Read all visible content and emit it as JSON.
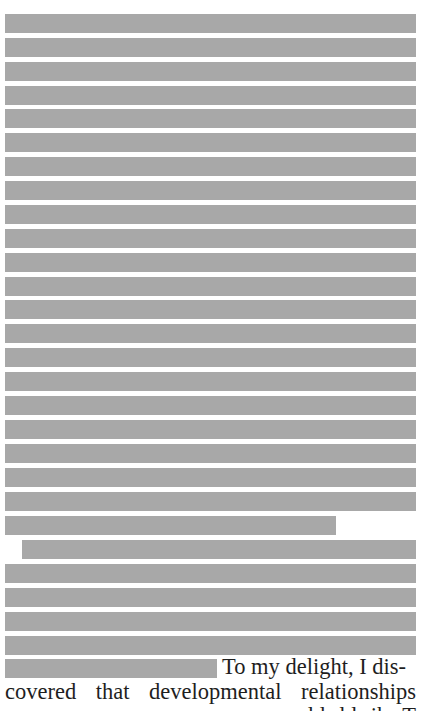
{
  "document": {
    "redaction_color": "#a8a8a8",
    "text_color": "#1e1e1e",
    "redacted_lines": [
      {
        "left": 5,
        "top": 14,
        "width": 411
      },
      {
        "left": 5,
        "top": 38,
        "width": 411
      },
      {
        "left": 5,
        "top": 62,
        "width": 411
      },
      {
        "left": 5,
        "top": 86,
        "width": 411
      },
      {
        "left": 5,
        "top": 109,
        "width": 411
      },
      {
        "left": 5,
        "top": 133,
        "width": 411
      },
      {
        "left": 5,
        "top": 157,
        "width": 411
      },
      {
        "left": 5,
        "top": 181,
        "width": 411
      },
      {
        "left": 5,
        "top": 205,
        "width": 411
      },
      {
        "left": 5,
        "top": 229,
        "width": 411
      },
      {
        "left": 5,
        "top": 253,
        "width": 411
      },
      {
        "left": 5,
        "top": 277,
        "width": 411
      },
      {
        "left": 5,
        "top": 300,
        "width": 411
      },
      {
        "left": 5,
        "top": 324,
        "width": 411
      },
      {
        "left": 5,
        "top": 348,
        "width": 411
      },
      {
        "left": 5,
        "top": 372,
        "width": 411
      },
      {
        "left": 5,
        "top": 396,
        "width": 411
      },
      {
        "left": 5,
        "top": 420,
        "width": 411
      },
      {
        "left": 5,
        "top": 444,
        "width": 411
      },
      {
        "left": 5,
        "top": 468,
        "width": 411
      },
      {
        "left": 5,
        "top": 492,
        "width": 411
      },
      {
        "left": 5,
        "top": 516,
        "width": 331
      },
      {
        "left": 22,
        "top": 540,
        "width": 394
      },
      {
        "left": 5,
        "top": 564,
        "width": 411
      },
      {
        "left": 5,
        "top": 588,
        "width": 411
      },
      {
        "left": 5,
        "top": 612,
        "width": 411
      },
      {
        "left": 5,
        "top": 636,
        "width": 411
      },
      {
        "left": 5,
        "top": 659,
        "width": 212
      }
    ],
    "tail_text": "To my delight, I dis-",
    "visible_line_words": [
      "covered",
      "that",
      "developmental",
      "relationships"
    ],
    "cut_off_line_hint": "… …  … … … T…"
  }
}
